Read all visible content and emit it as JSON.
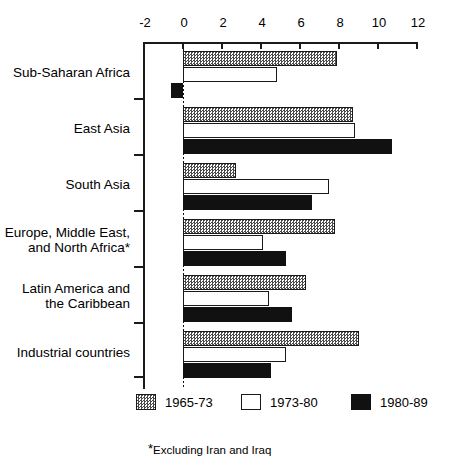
{
  "chart_data": {
    "type": "bar",
    "orientation": "horizontal",
    "title": "",
    "xlabel": "",
    "ylabel": "",
    "xlim": [
      -2,
      12
    ],
    "xticks": [
      -2,
      0,
      2,
      4,
      6,
      8,
      10,
      12
    ],
    "xtick_labels": [
      "-2",
      "0",
      "2",
      "4",
      "6",
      "8",
      "10",
      "12"
    ],
    "grid": false,
    "zero_reference_line": true,
    "legend_position": "bottom",
    "categories": [
      "Sub-Saharan Africa",
      "East Asia",
      "South Asia",
      "Europe, Middle East, and North Africa*",
      "Latin America and the Caribbean",
      "Industrial countries"
    ],
    "series": [
      {
        "name": "1965-73",
        "style": "hatched",
        "values": [
          7.9,
          8.7,
          2.7,
          7.8,
          6.3,
          9.0
        ]
      },
      {
        "name": "1973-80",
        "style": "white",
        "values": [
          4.8,
          8.8,
          7.5,
          4.1,
          4.4,
          5.3
        ]
      },
      {
        "name": "1980-89",
        "style": "black",
        "values": [
          -0.6,
          10.7,
          6.6,
          5.3,
          5.6,
          4.5
        ]
      }
    ],
    "footnote": "Excluding Iran and Iraq"
  },
  "axis": {
    "ticks": [
      {
        "label": "-2",
        "value": -2
      },
      {
        "label": "0",
        "value": 0
      },
      {
        "label": "2",
        "value": 2
      },
      {
        "label": "4",
        "value": 4
      },
      {
        "label": "6",
        "value": 6
      },
      {
        "label": "8",
        "value": 8
      },
      {
        "label": "10",
        "value": 10
      },
      {
        "label": "12",
        "value": 12
      }
    ]
  },
  "categories": [
    {
      "line1": "Sub-Saharan Africa",
      "line2": ""
    },
    {
      "line1": "East Asia",
      "line2": ""
    },
    {
      "line1": "South Asia",
      "line2": ""
    },
    {
      "line1": "Europe, Middle East,",
      "line2": "and North Africa*"
    },
    {
      "line1": "Latin America and",
      "line2": "the Caribbean"
    },
    {
      "line1": "Industrial countries",
      "line2": ""
    }
  ],
  "legend": [
    {
      "label": "1965-73",
      "style": "hatched"
    },
    {
      "label": "1973-80",
      "style": "white"
    },
    {
      "label": "1980-89",
      "style": "black"
    }
  ],
  "footnote": {
    "marker": "*",
    "text": "Excluding Iran and Iraq"
  },
  "colors": {
    "ink": "#111111",
    "hatch_gray": "#4a4a4a",
    "background": "#ffffff"
  }
}
